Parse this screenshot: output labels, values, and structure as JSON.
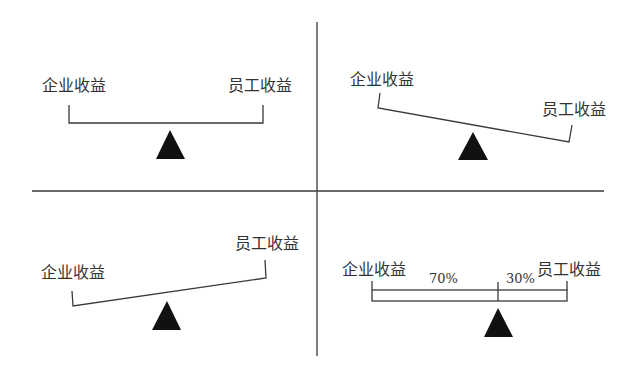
{
  "diagram": {
    "type": "balance-scale comparison (four quadrants)",
    "colors": {
      "line": "#3a3a3a",
      "fulcrum": "#111111",
      "text": "#333333"
    },
    "quadrants": [
      {
        "position": "top-left",
        "state": "balanced",
        "left_label": "企业收益",
        "right_label": "员工收益"
      },
      {
        "position": "top-right",
        "state": "tilted-right-down",
        "left_label": "企业收益",
        "right_label": "员工收益"
      },
      {
        "position": "bottom-left",
        "state": "tilted-left-down",
        "left_label": "企业收益",
        "right_label": "员工收益"
      },
      {
        "position": "bottom-right",
        "state": "balanced-split",
        "left_label": "企业收益",
        "right_label": "员工收益",
        "left_share": "70%",
        "right_share": "30%"
      }
    ]
  }
}
